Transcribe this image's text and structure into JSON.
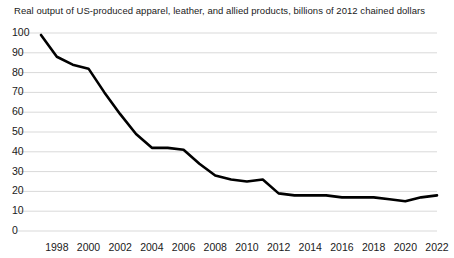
{
  "chart_data": {
    "type": "line",
    "title": "Real output of US-produced apparel, leather, and allied products, billions of 2012 chained dollars",
    "xlabel": "",
    "ylabel": "",
    "ylim": [
      0,
      100
    ],
    "xlim": [
      1997,
      2022
    ],
    "grid": true,
    "legend": "none",
    "yticks": [
      0,
      10,
      20,
      30,
      40,
      50,
      60,
      70,
      80,
      90,
      100
    ],
    "ytick_labels": [
      "0",
      "10",
      "20",
      "30",
      "40",
      "50",
      "60",
      "70",
      "80",
      "90",
      "100"
    ],
    "xticks": [
      1998,
      2000,
      2002,
      2004,
      2006,
      2008,
      2010,
      2012,
      2014,
      2016,
      2018,
      2020,
      2022
    ],
    "xtick_labels": [
      "1998",
      "2000",
      "2002",
      "2004",
      "2006",
      "2008",
      "2010",
      "2012",
      "2014",
      "2016",
      "2018",
      "2020",
      "2022"
    ],
    "line_color": "#000000",
    "grid_color": "#d9d9d9",
    "x": [
      1997,
      1998,
      1999,
      2000,
      2001,
      2002,
      2003,
      2004,
      2005,
      2006,
      2007,
      2008,
      2009,
      2010,
      2011,
      2012,
      2013,
      2014,
      2015,
      2016,
      2017,
      2018,
      2019,
      2020,
      2021,
      2022
    ],
    "values": [
      99,
      88,
      84,
      82,
      70,
      59,
      49,
      42,
      42,
      41,
      34,
      28,
      26,
      25,
      26,
      19,
      18,
      18,
      18,
      17,
      17,
      17,
      16,
      15,
      17,
      18
    ],
    "series": [
      {
        "name": "Real output of US-produced apparel, leather, and allied products",
        "values": [
          99,
          88,
          84,
          82,
          70,
          59,
          49,
          42,
          42,
          41,
          34,
          28,
          26,
          25,
          26,
          19,
          18,
          18,
          18,
          17,
          17,
          17,
          16,
          15,
          17,
          18
        ]
      }
    ]
  }
}
